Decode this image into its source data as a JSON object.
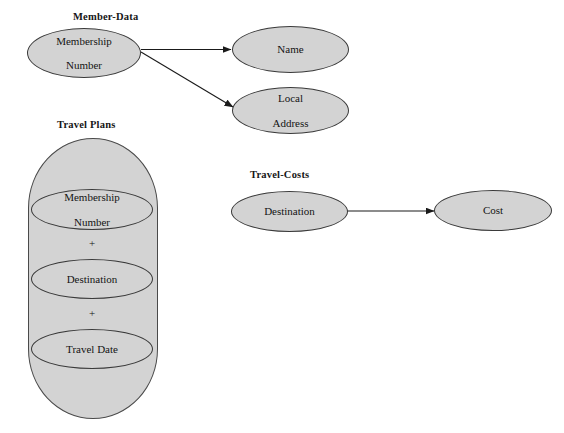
{
  "diagram": {
    "title_visible": false,
    "background_color": "#ffffff",
    "node_fill_color": "#d3d3d3",
    "node_stroke_color": "#3a3a3a",
    "edge_color": "#1a1a1a"
  },
  "groups": [
    {
      "id": "member-data",
      "label": "Member-Data"
    },
    {
      "id": "travel-plans",
      "label": "Travel Plans"
    },
    {
      "id": "travel-costs",
      "label": "Travel-Costs"
    }
  ],
  "nodes": {
    "member_key": {
      "label": "Membership Number",
      "line1": "Membership",
      "line2": "Number"
    },
    "name": {
      "label": "Name"
    },
    "local_address": {
      "label": "Local Address",
      "line1": "Local",
      "line2": "Address"
    },
    "tp_member_key": {
      "label": "Membership Number",
      "line1": "Membership",
      "line2": "Number"
    },
    "tp_destination": {
      "label": "Destination"
    },
    "tp_travel_date": {
      "label": "Travel Date"
    },
    "tc_destination": {
      "label": "Destination"
    },
    "tc_cost": {
      "label": "Cost"
    }
  },
  "connectors": {
    "plus_1": "+",
    "plus_2": "+"
  },
  "edges": [
    {
      "from": "member_key",
      "to": "name",
      "style": "arrow"
    },
    {
      "from": "member_key",
      "to": "local_address",
      "style": "arrow"
    },
    {
      "from": "tc_destination",
      "to": "tc_cost",
      "style": "arrow"
    }
  ]
}
